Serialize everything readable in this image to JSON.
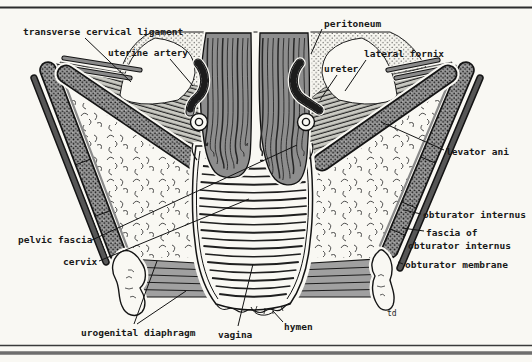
{
  "figure": {
    "labels": {
      "transverse_cervical_ligament": "transverse cervical ligament",
      "uterine_artery": "uterine artery",
      "peritoneum": "peritoneum",
      "lateral_fornix": "lateral fornix",
      "ureter": "ureter",
      "levator_ani": "levator ani",
      "obturator_internus": "obturator internus",
      "fascia_of_line1": "fascia of",
      "fascia_of_line2": "obturator internus",
      "obturator_membrane": "obturator membrane",
      "pelvic_fascia": "pelvic fascia",
      "cervix": "cervix",
      "urogenital_diaphragm": "urogenital diaphragm",
      "vagina": "vagina",
      "hymen": "hymen",
      "artist_initials": "td"
    },
    "colors": {
      "ink": "#181818",
      "paper": "#f9f8f3",
      "muscle_gray": "#8d8d8d",
      "band_gray": "#a0a0a0",
      "hatch_gray": "#c9c9c2"
    }
  }
}
